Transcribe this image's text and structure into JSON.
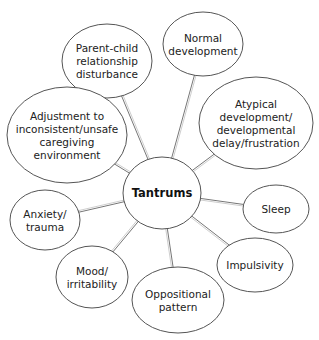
{
  "diagram": {
    "center": {
      "id": "tantrums",
      "label": "Tantrums",
      "cx": 162,
      "cy": 193,
      "rx": 39,
      "ry": 36
    },
    "nodes": [
      {
        "id": "parent-child",
        "lines": [
          "Parent-child",
          "relationship",
          "disturbance"
        ],
        "cx": 107,
        "cy": 61,
        "rx": 45,
        "ry": 37
      },
      {
        "id": "normal-development",
        "lines": [
          "Normal",
          "development"
        ],
        "cx": 203,
        "cy": 44,
        "rx": 40,
        "ry": 32
      },
      {
        "id": "atypical-development",
        "lines": [
          "Atypical",
          "development/",
          "developmental",
          "delay/frustration"
        ],
        "cx": 256,
        "cy": 123,
        "rx": 57,
        "ry": 46
      },
      {
        "id": "adjustment",
        "lines": [
          "Adjustment to",
          "inconsistent/unsafe",
          "caregiving",
          "environment"
        ],
        "cx": 67,
        "cy": 135,
        "rx": 60,
        "ry": 48
      },
      {
        "id": "anxiety-trauma",
        "lines": [
          "Anxiety/",
          "trauma"
        ],
        "cx": 45,
        "cy": 220,
        "rx": 35,
        "ry": 30
      },
      {
        "id": "sleep",
        "lines": [
          "Sleep"
        ],
        "cx": 276,
        "cy": 209,
        "rx": 33,
        "ry": 24
      },
      {
        "id": "mood-irritability",
        "lines": [
          "Mood/",
          "irritability"
        ],
        "cx": 92,
        "cy": 277,
        "rx": 36,
        "ry": 31
      },
      {
        "id": "impulsivity",
        "lines": [
          "Impulsivity"
        ],
        "cx": 255,
        "cy": 265,
        "rx": 38,
        "ry": 27
      },
      {
        "id": "oppositional-pattern",
        "lines": [
          "Oppositional",
          "pattern"
        ],
        "cx": 178,
        "cy": 300,
        "rx": 46,
        "ry": 33
      }
    ]
  }
}
